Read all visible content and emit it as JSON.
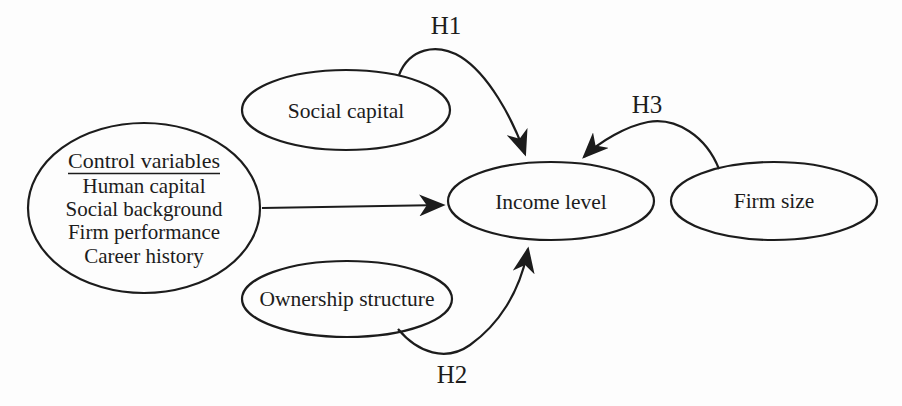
{
  "figure": {
    "type": "conceptual-model-diagram",
    "colors": {
      "ink": "#1c1c1c",
      "background": "#fdfdfd"
    },
    "nodes": {
      "social_capital": {
        "label": "Social capital"
      },
      "control_variables": {
        "title": "Control variables",
        "items": [
          "Human capital",
          "Social background",
          "Firm performance",
          "Career history"
        ]
      },
      "ownership_structure": {
        "label": "Ownership structure"
      },
      "income_level": {
        "label": "Income level"
      },
      "firm_size": {
        "label": "Firm size"
      }
    },
    "edges": {
      "h1": {
        "label": "H1",
        "from": "Social capital",
        "to": "Income level"
      },
      "h2": {
        "label": "H2",
        "from": "Ownership structure",
        "to": "Income level"
      },
      "h3": {
        "label": "H3",
        "from": "Firm size",
        "to": "Income level"
      },
      "controls": {
        "label": "",
        "from": "Control variables",
        "to": "Income level"
      }
    }
  }
}
